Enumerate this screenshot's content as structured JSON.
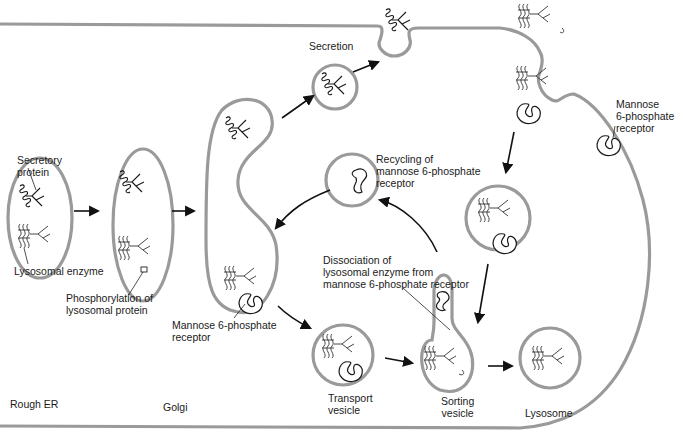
{
  "diagram": {
    "type": "biological-pathway",
    "topic": "Sorting of lysosomal enzymes via mannose 6-phosphate receptor",
    "colors": {
      "membrane": "#9a9a9a",
      "ink": "#1a1a1a",
      "background": "#ffffff"
    },
    "compartments": {
      "rough_er": "Rough ER",
      "golgi": "Golgi",
      "transport_vesicle": "Transport\nvesicle",
      "sorting_vesicle": "Sorting\nvesicle",
      "lysosome": "Lysosome"
    },
    "labels": {
      "secretory_protein": "Secretory\nprotein",
      "lysosomal_enzyme": "Lysosomal enzyme",
      "phosphorylation": "Phosphorylation of\nlysosomal protein",
      "m6p_receptor_golgi": "Mannose 6-phosphate\nreceptor",
      "secretion": "Secretion",
      "recycling": "Recycling of\nmannose 6-phosphate\nreceptor",
      "dissociation": "Dissociation of\nlysosomal enzyme from\nmannose 6-phosphate receptor",
      "m6p_receptor_membrane": "Mannose\n6-phosphate\nreceptor"
    },
    "flow": [
      {
        "from": "Rough ER",
        "to": "Golgi vesicle"
      },
      {
        "from": "Golgi vesicle",
        "to": "Golgi"
      },
      {
        "from": "Golgi",
        "to": "Secretory vesicle"
      },
      {
        "from": "Secretory vesicle",
        "to": "Secretion"
      },
      {
        "from": "Golgi",
        "to": "Transport vesicle"
      },
      {
        "from": "Transport vesicle",
        "to": "Sorting vesicle"
      },
      {
        "from": "Sorting vesicle",
        "to": "Lysosome"
      },
      {
        "from": "Sorting vesicle",
        "to": "Recycling vesicle"
      },
      {
        "from": "Recycling vesicle",
        "to": "Golgi"
      },
      {
        "from": "Plasma membrane endocytosis",
        "to": "Endocytic vesicle"
      },
      {
        "from": "Endocytic vesicle",
        "to": "Sorting vesicle"
      }
    ]
  }
}
